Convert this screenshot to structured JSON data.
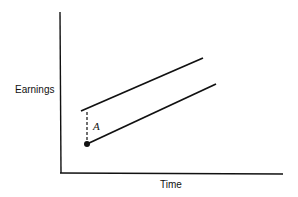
{
  "diagram": {
    "y_axis_label": "Earnings",
    "x_axis_label": "Time",
    "gap_label": "A",
    "colors": {
      "line": "#111111",
      "background": "#ffffff"
    },
    "elements": [
      {
        "type": "axis",
        "name": "y-axis"
      },
      {
        "type": "axis",
        "name": "x-axis"
      },
      {
        "type": "line",
        "name": "upper-earnings-line",
        "slope": "upward"
      },
      {
        "type": "line",
        "name": "lower-earnings-line",
        "slope": "upward"
      },
      {
        "type": "dashed-line",
        "name": "vertical-gap-A"
      },
      {
        "type": "point",
        "name": "start-point"
      }
    ]
  }
}
